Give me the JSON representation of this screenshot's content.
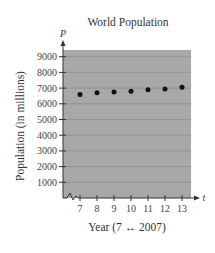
{
  "chart_data": {
    "type": "scatter",
    "title": "World Population",
    "xlabel": "Year (7 ↔ 2007)",
    "ylabel": "Population (in millions)",
    "x_axis_var": "t",
    "y_axis_var": "P",
    "x": [
      7,
      8,
      9,
      10,
      11,
      12,
      13
    ],
    "series": [
      {
        "name": "World Population",
        "values": [
          6600,
          6700,
          6750,
          6800,
          6900,
          6950,
          7050
        ]
      }
    ],
    "x_ticks": [
      "7",
      "8",
      "9",
      "10",
      "11",
      "12",
      "13"
    ],
    "y_ticks": [
      "1000",
      "2000",
      "3000",
      "4000",
      "5000",
      "6000",
      "7000",
      "8000",
      "9000"
    ],
    "xlim": [
      6,
      13.5
    ],
    "ylim": [
      0,
      9500
    ],
    "grid": true,
    "axis_break": "x",
    "plot_background": "#a8a8a8",
    "point_color": "#111111"
  }
}
